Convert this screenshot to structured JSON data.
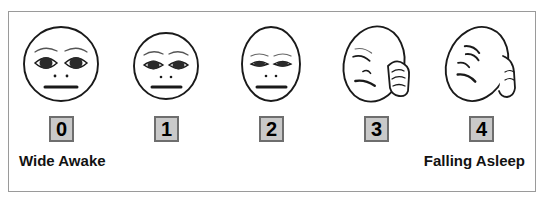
{
  "scale": {
    "title": "Sleepiness Rating Scale",
    "frame_border_color": "#9a9a9a",
    "background_color": "#ffffff",
    "ink_color": "#1a1a1a",
    "box_fill_color": "#c9c9c9",
    "box_border_color": "#6e6e6e",
    "left_anchor_label": "Wide Awake",
    "right_anchor_label": "Falling Asleep",
    "items": [
      {
        "value": "0",
        "face_name": "face-wide-awake",
        "description": "Round face, wide open alert eyes with eyebrows, two nostril dots, straight mouth",
        "eye_state": "wide-open",
        "head_tilt_deg": 0,
        "has_hand": false
      },
      {
        "value": "1",
        "face_name": "face-slightly-drowsy",
        "description": "Round face, slightly narrowed eyes with eyebrows, two nostril dots, straight mouth",
        "eye_state": "slightly-narrowed",
        "head_tilt_deg": 0,
        "has_hand": false
      },
      {
        "value": "2",
        "face_name": "face-drowsy",
        "description": "Oval face, droopy half-closed eyes, two nostril dots, straight mouth",
        "eye_state": "half-closed",
        "head_tilt_deg": 0,
        "has_hand": false
      },
      {
        "value": "3",
        "face_name": "face-rubbing-eye",
        "description": "Tilted oval face, closed eyes, frowning mouth, hand rubbing the eye",
        "eye_state": "closed",
        "head_tilt_deg": 14,
        "has_hand": true
      },
      {
        "value": "4",
        "face_name": "face-falling-asleep",
        "description": "Strongly tilted oval face, closed slit eyes, frowning mouth, hand at side of head",
        "eye_state": "closed-slits",
        "head_tilt_deg": 22,
        "has_hand": true
      }
    ]
  }
}
